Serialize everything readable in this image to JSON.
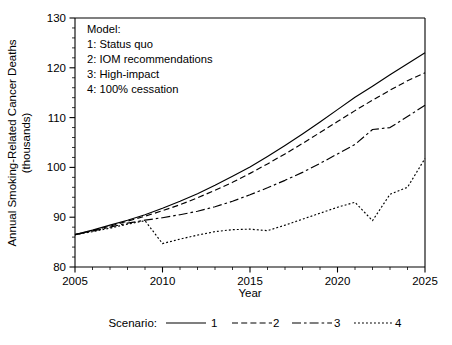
{
  "chart_data": {
    "type": "line",
    "title": "",
    "xlabel": "Year",
    "ylabel": "Annual Smoking-Related Cancer Deaths (thousands)",
    "xlim": [
      2005,
      2025
    ],
    "ylim": [
      80,
      130
    ],
    "xticks": [
      2005,
      2010,
      2015,
      2020,
      2025
    ],
    "yticks": [
      80,
      90,
      100,
      110,
      120,
      130
    ],
    "x_minor_step": 1,
    "y_minor_step": 2,
    "grid": false,
    "legend_position": "below-axes",
    "legend_title": "Scenario:",
    "x": [
      2005,
      2006,
      2007,
      2008,
      2009,
      2010,
      2011,
      2012,
      2013,
      2014,
      2015,
      2016,
      2017,
      2018,
      2019,
      2020,
      2021,
      2022,
      2023,
      2024,
      2025
    ],
    "series": [
      {
        "name": "1",
        "label": "Status quo",
        "style": "solid",
        "values": [
          86.5,
          87.4,
          88.4,
          89.4,
          90.5,
          91.8,
          93.2,
          94.7,
          96.4,
          98.2,
          100.1,
          102.2,
          104.4,
          106.7,
          109.1,
          111.6,
          114.1,
          116.3,
          118.6,
          120.8,
          123.0
        ]
      },
      {
        "name": "2",
        "label": "IOM recommendations",
        "style": "dashed",
        "values": [
          86.5,
          87.3,
          88.2,
          89.2,
          90.2,
          91.3,
          92.5,
          93.9,
          95.4,
          97.0,
          98.8,
          100.7,
          102.7,
          104.8,
          107.0,
          109.2,
          111.4,
          113.5,
          115.5,
          117.4,
          119.0
        ]
      },
      {
        "name": "3",
        "label": "High-impact",
        "style": "long-dash-dot",
        "values": [
          86.5,
          87.2,
          88.0,
          88.8,
          89.4,
          89.9,
          90.5,
          91.2,
          92.1,
          93.2,
          94.5,
          95.9,
          97.4,
          99.0,
          100.8,
          102.7,
          104.6,
          107.6,
          108.0,
          110.2,
          112.5
        ]
      },
      {
        "name": "4",
        "label": "100% cessation",
        "style": "dotted",
        "values": [
          86.5,
          87.1,
          87.8,
          88.6,
          89.3,
          84.7,
          85.6,
          86.4,
          87.1,
          87.5,
          87.6,
          87.3,
          88.4,
          89.6,
          90.8,
          92.0,
          93.0,
          89.3,
          94.6,
          96.0,
          101.8
        ]
      }
    ],
    "model_note": {
      "heading": "Model:",
      "items": [
        "1: Status quo",
        "2: IOM recommendations",
        "3: High-impact",
        "4: 100% cessation"
      ]
    }
  },
  "colors": {
    "axis": "#000000",
    "series": "#000000",
    "background": "#ffffff"
  }
}
